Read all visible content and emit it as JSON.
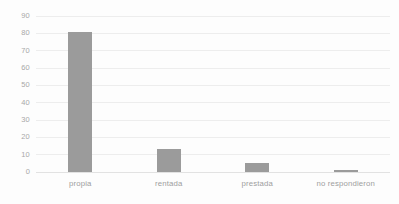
{
  "chart_data": {
    "type": "bar",
    "title": "",
    "subtitle": "",
    "xlabel": "",
    "ylabel": "",
    "categories": [
      "propia",
      "rentada",
      "prestada",
      "no respondieron"
    ],
    "values": [
      81,
      13,
      5,
      1
    ],
    "series": [
      {
        "name": "",
        "values": [
          81,
          13,
          5,
          1
        ]
      }
    ],
    "ylim": [
      0,
      90
    ],
    "yticks": [
      0,
      10,
      20,
      30,
      40,
      50,
      60,
      70,
      80,
      90
    ],
    "ytick_labels": [
      "0",
      "10",
      "20",
      "30",
      "40",
      "50",
      "60",
      "70",
      "80",
      "90"
    ],
    "grid": true,
    "grid_axis": "y",
    "legend": false,
    "legend_position": "none",
    "bar_color": "#9b9b9b",
    "gridline_color": "#ededed",
    "axis_label_color": "#a8a8a8",
    "background_color": "#fdfdfd"
  }
}
